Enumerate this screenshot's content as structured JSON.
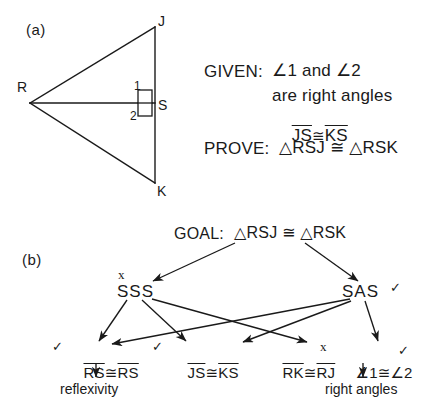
{
  "figure": {
    "panel_a_label": "(a)",
    "panel_b_label": "(b)"
  },
  "panel_a": {
    "vertices": [
      {
        "name": "R",
        "label": "R",
        "x": 30,
        "y": 103
      },
      {
        "name": "J",
        "label": "J",
        "x": 155,
        "y": 27
      },
      {
        "name": "K",
        "label": "K",
        "x": 155,
        "y": 183
      },
      {
        "name": "S",
        "label": "S",
        "x": 155,
        "y": 103
      }
    ],
    "vertex_labels": {
      "R": "R",
      "J": "J",
      "K": "K",
      "S": "S"
    },
    "angle_labels": {
      "angle1": "1",
      "angle2": "2"
    },
    "right_angle_marker": "right-angle-square",
    "given": {
      "heading": "GIVEN:",
      "line1": "∠1 and ∠2",
      "line2": "are right angles",
      "line3_left": "JS",
      "line3_symbol": "≅",
      "line3_right": "KS"
    },
    "prove": {
      "heading": "PROVE:",
      "statement": "△RSJ ≅ △RSK"
    }
  },
  "panel_b": {
    "goal": {
      "heading": "GOAL:",
      "statement": "△RSJ ≅ △RSK"
    },
    "nodes": [
      {
        "id": "sss",
        "label": "SSS",
        "mark": "x",
        "mark_position": "above-left"
      },
      {
        "id": "sas",
        "label": "SAS",
        "mark": "✓",
        "mark_position": "right"
      }
    ],
    "leaves": [
      {
        "id": "rs-rs",
        "left": "RS",
        "symbol": "≅",
        "right": "RS",
        "mark": "✓",
        "mark_position": "left",
        "reason": "reflexivity"
      },
      {
        "id": "js-ks",
        "left": "JS",
        "symbol": "≅",
        "right": "KS",
        "mark": "✓",
        "mark_position": "left",
        "reason": ""
      },
      {
        "id": "rk-rj",
        "left": "RK",
        "symbol": "≅",
        "right": "RJ",
        "mark": "x",
        "mark_position": "above-right",
        "reason": ""
      },
      {
        "id": "angle1-angle2",
        "left": "∠1",
        "symbol": "≅",
        "right": "∠2",
        "mark": "✓",
        "mark_position": "above-right",
        "reason": "right angles"
      }
    ],
    "edges": [
      {
        "from": "goal",
        "to": "sss"
      },
      {
        "from": "goal",
        "to": "sas"
      },
      {
        "from": "sss",
        "to": "rs-rs"
      },
      {
        "from": "sss",
        "to": "js-ks"
      },
      {
        "from": "sss",
        "to": "rk-rj"
      },
      {
        "from": "sas",
        "to": "rs-rs"
      },
      {
        "from": "sas",
        "to": "js-ks"
      },
      {
        "from": "sas",
        "to": "angle1-angle2"
      },
      {
        "from": "rs-rs",
        "to": "reflexivity"
      },
      {
        "from": "angle1-angle2",
        "to": "right-angles"
      }
    ],
    "reasons": {
      "reflexivity": "reflexivity",
      "right_angles": "right angles"
    }
  },
  "colors": {
    "ink": "#1a1a1a",
    "background": "#ffffff"
  }
}
